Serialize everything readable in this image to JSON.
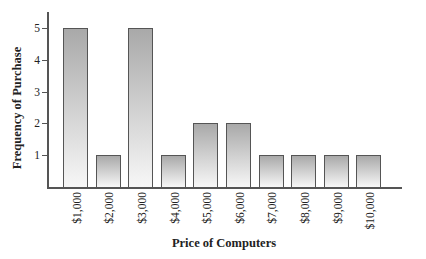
{
  "chart_data": {
    "type": "bar",
    "title": "",
    "xlabel": "Price of Computers",
    "ylabel": "Frequency of Purchase",
    "categories": [
      "$1,000",
      "$2,000",
      "$3,000",
      "$4,000",
      "$5,000",
      "$6,000",
      "$7,000",
      "$8,000",
      "$9,000",
      "$10,000"
    ],
    "values": [
      5,
      1,
      5,
      1,
      2,
      2,
      1,
      1,
      1,
      1
    ],
    "yticks": [
      1,
      2,
      3,
      4,
      5
    ],
    "ylim": [
      0,
      5.5
    ],
    "grid": false,
    "legend": null
  },
  "colors": {
    "bar_top": "#a9a9a9",
    "bar_bottom": "#f7f7f7",
    "bar_edge": "#555555",
    "axis": "#555555"
  }
}
